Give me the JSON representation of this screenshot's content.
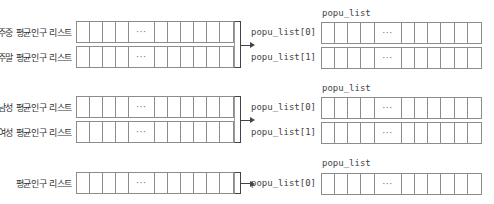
{
  "groups": [
    {
      "source_labels": [
        "주중 평균인구 리스트",
        "주말 평균인구 리스트"
      ],
      "target_title": "popu_list",
      "target_labels": [
        "popu_list[0]",
        "popu_list[1]"
      ]
    },
    {
      "source_labels": [
        "남성 평균인구 리스트",
        "여성 평균인구 리스트"
      ],
      "target_title": "popu_list",
      "target_labels": [
        "popu_list[0]",
        "popu_list[1]"
      ]
    },
    {
      "source_labels": [
        "평균인구 리스트"
      ],
      "target_title": "popu_list",
      "target_labels": [
        "popu_list[0]"
      ]
    }
  ],
  "ellipsis": "···",
  "colors": {
    "cell_border": "#8c8c8c",
    "bracket": "#444444",
    "text": "#333333"
  }
}
